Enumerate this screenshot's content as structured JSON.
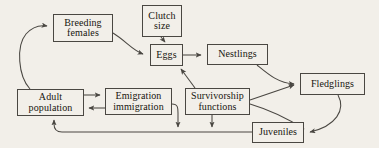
{
  "diagram": {
    "background_color": "#f2efe9",
    "line_color": "#4a4742",
    "text_color": "#17150f",
    "nodes": [
      {
        "id": "breeding_females",
        "line1": "Breeding",
        "line2": "females"
      },
      {
        "id": "clutch_size",
        "line1": "Clutch",
        "line2": "size"
      },
      {
        "id": "eggs",
        "line1": "Eggs",
        "line2": ""
      },
      {
        "id": "nestlings",
        "line1": "Nestlings",
        "line2": ""
      },
      {
        "id": "fledglings",
        "line1": "Fledglings",
        "line2": ""
      },
      {
        "id": "adult_population",
        "line1": "Adult",
        "line2": "population"
      },
      {
        "id": "emigration_immigration",
        "line1": "Emigration",
        "line2": "immigration"
      },
      {
        "id": "survivorship_functions",
        "line1": "Survivorship",
        "line2": "functions"
      },
      {
        "id": "juveniles",
        "line1": "Juveniles",
        "line2": ""
      }
    ],
    "edges": [
      {
        "from": "adult_population",
        "to": "breeding_females",
        "style": "curved"
      },
      {
        "from": "breeding_females",
        "to": "eggs",
        "style": "curved"
      },
      {
        "from": "clutch_size",
        "to": "eggs",
        "style": "straight"
      },
      {
        "from": "eggs",
        "to": "nestlings",
        "style": "straight"
      },
      {
        "from": "survivorship_functions",
        "to": "eggs",
        "style": "straight"
      },
      {
        "from": "nestlings",
        "to": "fledglings",
        "style": "curved"
      },
      {
        "from": "survivorship_functions",
        "to": "fledglings",
        "style": "straight"
      },
      {
        "from": "survivorship_functions",
        "to": "juveniles",
        "style": "curved"
      },
      {
        "from": "fledglings",
        "to": "juveniles",
        "style": "curved"
      },
      {
        "from": "juveniles",
        "to": "adult_population",
        "style": "elbow"
      },
      {
        "from": "adult_population",
        "to": "emigration_immigration",
        "style": "straight"
      },
      {
        "from": "emigration_immigration",
        "to": "adult_population",
        "style": "straight"
      },
      {
        "from": "emigration_immigration",
        "to": "outflow",
        "style": "elbow"
      },
      {
        "from": "survivorship_functions",
        "to": "outflow",
        "style": "straight"
      }
    ]
  }
}
